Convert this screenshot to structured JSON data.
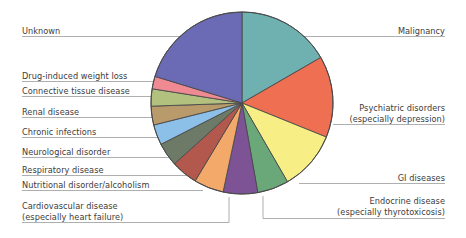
{
  "figure": {
    "type": "pie-chart-with-leader-labels",
    "background": "#ffffff",
    "text_color": "#3c3c3c",
    "leader_line_color": "#9a9a9a",
    "slice_outline_color": "#4a4a4a"
  },
  "chart_data": {
    "type": "pie",
    "title": "",
    "xlabel": "",
    "ylabel": "",
    "legend_position": "leader-labels",
    "grid": false,
    "start_angle_deg": 0,
    "direction": "clockwise",
    "center": {
      "x": 242,
      "y": 103
    },
    "radius": 91,
    "categories": [
      "Malignancy",
      "Psychiatric disorders (especially depression)",
      "GI diseases",
      "Endocrine disease (especially thyrotoxicosis)",
      "Cardiovascular disease (especially heart failure)",
      "Nutritional disorder/alcoholism",
      "Respiratory disease",
      "Neurological disorder",
      "Chronic infections",
      "Renal disease",
      "Connective tissue disease",
      "Drug-induced weight loss",
      "Unknown"
    ],
    "values": [
      16.7,
      14.4,
      10.6,
      5.6,
      6.1,
      5.3,
      4.7,
      4.2,
      3.6,
      3.3,
      3.1,
      2.2,
      20.2
    ],
    "angles_deg": [
      60,
      52,
      38,
      20,
      22,
      19,
      17,
      15,
      13,
      12,
      11,
      8,
      73
    ],
    "colors": [
      "#6fb0b0",
      "#ef6f52",
      "#f7ef85",
      "#6aa87a",
      "#7d5395",
      "#f2a96a",
      "#b3584c",
      "#6e7a68",
      "#8dc0e8",
      "#b99a6b",
      "#b2c27e",
      "#f08a92",
      "#6b6bb5"
    ]
  },
  "labels": {
    "left": [
      {
        "name": "unknown",
        "lines": [
          "Unknown"
        ]
      },
      {
        "name": "drug-induced-weight-loss",
        "lines": [
          "Drug-induced weight loss"
        ]
      },
      {
        "name": "connective-tissue-disease",
        "lines": [
          "Connective tissue disease"
        ]
      },
      {
        "name": "renal-disease",
        "lines": [
          "Renal disease"
        ]
      },
      {
        "name": "chronic-infections",
        "lines": [
          "Chronic infections"
        ]
      },
      {
        "name": "neurological-disorder",
        "lines": [
          "Neurological disorder"
        ]
      },
      {
        "name": "respiratory-disease",
        "lines": [
          "Respiratory disease"
        ]
      },
      {
        "name": "nutritional-disorder-alcoholism",
        "lines": [
          "Nutritional disorder/alcoholism"
        ]
      },
      {
        "name": "cardiovascular-disease",
        "lines": [
          "Cardiovascular disease",
          "(especially heart failure)"
        ]
      }
    ],
    "right": [
      {
        "name": "malignancy",
        "lines": [
          "Malignancy"
        ]
      },
      {
        "name": "psychiatric-disorders",
        "lines": [
          "Psychiatric disorders",
          "(especially depression)"
        ]
      },
      {
        "name": "gi-diseases",
        "lines": [
          "GI diseases"
        ]
      },
      {
        "name": "endocrine-disease",
        "lines": [
          "Endocrine disease",
          "(especially thyrotoxicosis)"
        ]
      }
    ]
  }
}
